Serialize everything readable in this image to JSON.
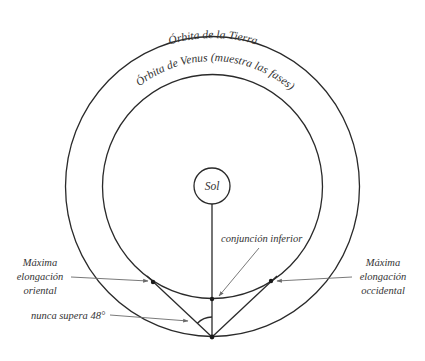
{
  "diagram": {
    "earth_orbit_label": "Órbita de la Tierra",
    "venus_orbit_label": "Órbita  de Venus (muestra las fases)",
    "sun_label": "Sol",
    "inferior_conjunction_label": "conjunción inferior",
    "eastern_elongation": {
      "line1": "Máxima",
      "line2": "elongación",
      "line3": "oriental"
    },
    "western_elongation": {
      "line1": "Máxima",
      "line2": "elongación",
      "line3": "occidental"
    },
    "max_angle_label": "nunca supera 48°",
    "colors": {
      "line": "#2a2a2a",
      "arrow": "#6a6a6a",
      "text": "#333333",
      "background": "#ffffff"
    }
  }
}
